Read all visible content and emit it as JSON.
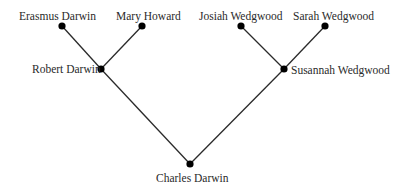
{
  "diagram": {
    "type": "family-tree",
    "line_color": "#2a2a2a",
    "node_color": "#000000",
    "nodes": [
      {
        "id": "erasmus",
        "label": "Erasmus Darwin",
        "x": 62,
        "y": 26
      },
      {
        "id": "mary",
        "label": "Mary Howard",
        "x": 142,
        "y": 26
      },
      {
        "id": "robert",
        "label": "Robert Darwin",
        "x": 101,
        "y": 69
      },
      {
        "id": "josiah",
        "label": "Josiah Wedgwood",
        "x": 241,
        "y": 26
      },
      {
        "id": "sarah",
        "label": "Sarah Wedgwood",
        "x": 325,
        "y": 26
      },
      {
        "id": "susannah",
        "label": "Susannah Wedgwood",
        "x": 284,
        "y": 69
      },
      {
        "id": "charles",
        "label": "Charles Darwin",
        "x": 190,
        "y": 164
      }
    ],
    "edges": [
      {
        "from": "erasmus",
        "to": "robert"
      },
      {
        "from": "mary",
        "to": "robert"
      },
      {
        "from": "josiah",
        "to": "susannah"
      },
      {
        "from": "sarah",
        "to": "susannah"
      },
      {
        "from": "robert",
        "to": "charles"
      },
      {
        "from": "susannah",
        "to": "charles"
      }
    ]
  },
  "labels": {
    "erasmus": "Erasmus Darwin",
    "mary": "Mary Howard",
    "robert": "Robert Darwin",
    "josiah": "Josiah Wedgwood",
    "sarah": "Sarah Wedgwood",
    "susannah": "Susannah Wedgwood",
    "charles": "Charles Darwin"
  }
}
